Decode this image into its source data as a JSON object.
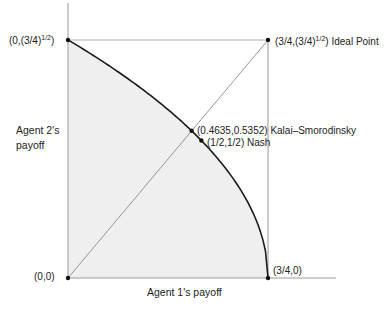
{
  "axes": {
    "x_label": "Agent 1's payoff",
    "y_label_line1": "Agent 2's",
    "y_label_line2": "payoff"
  },
  "points": {
    "origin": {
      "label": "(0,0)",
      "x": 0,
      "y": 0
    },
    "top_left": {
      "label_prefix": "(0,(3/4)",
      "label_sup": "1/2",
      "label_suffix": ")",
      "x": 0,
      "y": 0.866
    },
    "ideal": {
      "label_prefix": "(3/4,(3/4)",
      "label_sup": "1/2",
      "label_suffix": ") Ideal Point",
      "x": 0.75,
      "y": 0.866
    },
    "bottom_right": {
      "label": "(3/4,0)",
      "x": 0.75,
      "y": 0
    },
    "kalai_smorodinsky": {
      "label": "(0.4635,0.5352) Kalai–Smorodinsky",
      "x": 0.4635,
      "y": 0.5352
    },
    "nash": {
      "label": "(1/2,1/2) Nash",
      "x": 0.5,
      "y": 0.5
    }
  },
  "curve": {
    "equation": "y = sqrt(3/4 - x)",
    "x_range": [
      0,
      0.75
    ]
  },
  "colors": {
    "feasible_fill": "#efefef",
    "frontier": "#1a1a1a",
    "guide_lines": "#8a8a8a",
    "axes": "#9a9a9a",
    "points": "#111111"
  }
}
